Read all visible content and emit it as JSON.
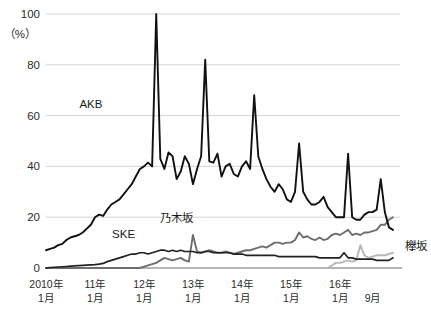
{
  "chart_data": {
    "type": "line",
    "title": "",
    "xlabel": "",
    "ylabel": "",
    "unit_label": "（%）",
    "ylim": [
      0,
      100
    ],
    "yticks": [
      0,
      20,
      40,
      60,
      80,
      100
    ],
    "ytick_labels": [
      "0",
      "20",
      "40",
      "60",
      "80",
      "100"
    ],
    "grid": true,
    "legend_position": "inline-annotations",
    "x_axis_note": "Monthly values from 2010-01 through 2016-09",
    "xtick_labels": [
      {
        "line1": "2010年",
        "line2": "1月"
      },
      {
        "line1": "11年",
        "line2": "1月"
      },
      {
        "line1": "12年",
        "line2": "1月"
      },
      {
        "line1": "13年",
        "line2": "1月"
      },
      {
        "line1": "14年",
        "line2": "1月"
      },
      {
        "line1": "15年",
        "line2": "1月"
      },
      {
        "line1": "16年",
        "line2": "1月"
      },
      {
        "line1": "",
        "line2": "9月"
      }
    ],
    "xtick_index": [
      0,
      12,
      24,
      36,
      48,
      60,
      72,
      80
    ],
    "annotations": [
      {
        "text": "AKB",
        "series": "AKB48",
        "x_index": 11,
        "y_value": 63
      },
      {
        "text": "SKE",
        "series": "SKE48",
        "x_index": 19,
        "y_value": 12
      },
      {
        "text": "乃木坂",
        "series": "乃木坂46",
        "x_index": 32,
        "y_value": 18
      },
      {
        "text": "欅坂",
        "series": "欅坂46",
        "x_index": 83,
        "y_value": 7
      }
    ],
    "series": [
      {
        "name": "AKB48",
        "color": "#111111",
        "width": 1.9,
        "values": [
          7,
          7.5,
          8,
          9,
          9.5,
          11,
          12,
          12.5,
          13,
          14,
          15.5,
          17,
          20,
          21,
          20.5,
          23,
          25,
          26,
          27,
          29,
          31,
          33,
          36,
          39,
          40,
          41.5,
          40,
          100,
          43,
          39,
          45.5,
          44,
          35,
          38,
          44,
          41,
          33,
          39,
          44,
          82,
          42,
          41.5,
          45,
          36,
          40,
          41,
          37,
          36,
          40,
          42,
          39,
          68,
          44,
          39,
          35,
          32,
          30,
          33,
          31,
          27,
          26,
          30,
          49,
          30,
          27,
          25,
          25,
          26,
          28,
          24,
          22,
          20,
          20,
          20,
          45,
          20,
          19,
          19,
          21,
          22,
          22,
          23,
          35,
          22,
          16,
          15
        ]
      },
      {
        "name": "乃木坂46",
        "color": "#6e6e6e",
        "width": 1.9,
        "values": [
          0,
          0,
          0,
          0,
          0,
          0,
          0,
          0,
          0,
          0,
          0,
          0,
          0,
          0,
          0,
          0,
          0,
          0,
          0,
          0,
          0,
          0,
          0,
          0,
          0.5,
          1,
          1.5,
          2,
          3,
          4,
          3.5,
          3,
          3.5,
          4,
          3,
          2.5,
          13,
          6.5,
          6,
          6.5,
          7,
          6.5,
          6,
          6,
          6.5,
          6,
          5.5,
          6,
          6.5,
          7,
          7,
          7.5,
          8,
          8.5,
          8,
          9,
          10,
          10,
          9.5,
          10,
          10,
          11,
          14,
          12,
          12.5,
          11.5,
          11,
          12,
          11,
          11.5,
          13,
          13.5,
          13,
          14,
          15,
          13,
          13.5,
          13,
          14,
          14,
          14.5,
          15,
          17,
          17,
          19,
          20
        ]
      },
      {
        "name": "SKE48",
        "color": "#222222",
        "width": 1.7,
        "values": [
          0,
          0.2,
          0.3,
          0.4,
          0.5,
          0.6,
          0.7,
          0.8,
          0.9,
          1,
          1.1,
          1.2,
          1.3,
          1.5,
          1.8,
          2.5,
          3,
          3.5,
          4,
          4.5,
          5,
          5.5,
          5.5,
          6,
          6,
          5.5,
          6,
          6.5,
          7,
          7,
          6.5,
          7,
          6.5,
          7,
          6.5,
          6.5,
          6.5,
          6,
          6,
          6.5,
          6.5,
          6,
          6,
          6,
          6,
          6,
          5.5,
          5.5,
          5.5,
          5,
          5,
          5,
          5,
          5,
          5,
          5,
          5,
          4.5,
          4.5,
          4.5,
          4.5,
          4.5,
          4.5,
          4.5,
          4.5,
          4.5,
          4.5,
          4,
          4,
          4,
          4,
          4,
          4,
          6,
          4,
          4,
          3.5,
          3.5,
          3.5,
          3.5,
          3.5,
          3,
          3,
          3,
          3,
          4
        ]
      },
      {
        "name": "欅坂46",
        "color": "#b8b8b8",
        "width": 1.9,
        "values": [
          0,
          0,
          0,
          0,
          0,
          0,
          0,
          0,
          0,
          0,
          0,
          0,
          0,
          0,
          0,
          0,
          0,
          0,
          0,
          0,
          0,
          0,
          0,
          0,
          0,
          0,
          0,
          0,
          0,
          0,
          0,
          0,
          0,
          0,
          0,
          0,
          0,
          0,
          0,
          0,
          0,
          0,
          0,
          0,
          0,
          0,
          0,
          0,
          0,
          0,
          0,
          0,
          0,
          0,
          0,
          0,
          0,
          0,
          0,
          0,
          0,
          0,
          0,
          0,
          0,
          0,
          0,
          0,
          0,
          0,
          1,
          2,
          2,
          2.5,
          3,
          2.5,
          3,
          9,
          5,
          4,
          4.5,
          5,
          5,
          5,
          5.5,
          6
        ]
      }
    ],
    "colors": {
      "gridline": "#cfcfcf",
      "baseline": "#9a9a9a",
      "text": "#231f20",
      "background": "#ffffff"
    }
  }
}
